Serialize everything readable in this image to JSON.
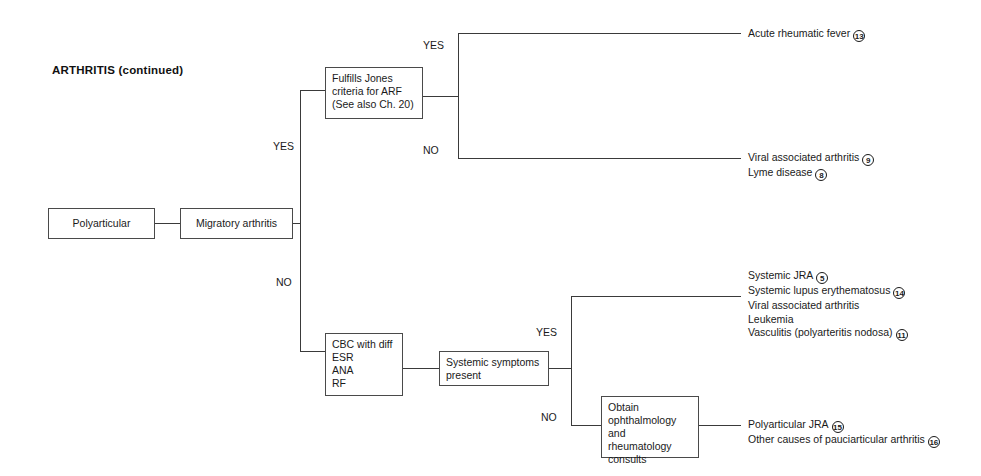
{
  "diagram": {
    "title": "ARTHRITIS (continued)",
    "nodes": {
      "polyarticular": "Polyarticular",
      "migratory": "Migratory arthritis",
      "jones": "Fulfills Jones\ncriteria for ARF\n(See also Ch. 20)",
      "labs": "CBC with diff\nESR\nANA\nRF",
      "systemic_symptoms": "Systemic symptoms\npresent",
      "consults": "Obtain\nophthalmology and\nrheumatology\nconsults"
    },
    "branch_labels": {
      "migratory_yes": "YES",
      "migratory_no": "NO",
      "jones_yes": "YES",
      "jones_no": "NO",
      "systemic_yes": "YES",
      "systemic_no": "NO"
    },
    "outcomes": {
      "arf": [
        {
          "text": "Acute rheumatic fever",
          "ref": "13"
        }
      ],
      "viral_lyme": [
        {
          "text": "Viral associated arthritis",
          "ref": "9"
        },
        {
          "text": "Lyme disease",
          "ref": "8"
        }
      ],
      "systemic_list": [
        {
          "text": "Systemic JRA",
          "ref": "5"
        },
        {
          "text": "Systemic lupus erythematosus",
          "ref": "14"
        },
        {
          "text": "Viral associated arthritis",
          "ref": ""
        },
        {
          "text": "Leukemia",
          "ref": ""
        },
        {
          "text": "Vasculitis (polyarteritis nodosa)",
          "ref": "11"
        }
      ],
      "pauciarticular": [
        {
          "text": "Polyarticular JRA",
          "ref": "15"
        },
        {
          "text": "Other causes of pauciarticular arthritis",
          "ref": "16"
        }
      ]
    },
    "colors": {
      "line": "#3a3a3a",
      "box_border": "#4a4a4a",
      "text": "#1a1a1a",
      "background": "#ffffff"
    }
  }
}
